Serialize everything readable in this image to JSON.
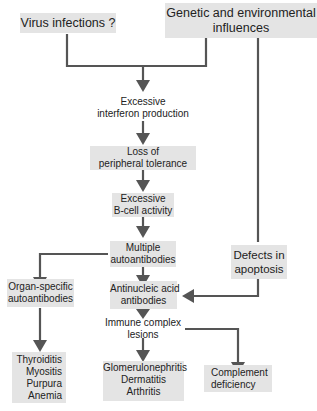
{
  "diagram": {
    "colors": {
      "box_fill": "#e4e4e4",
      "connector": "#555555",
      "text": "#222222",
      "background": "#ffffff"
    },
    "nodes": {
      "virus": {
        "lines": [
          "Virus infections ?"
        ]
      },
      "genetic": {
        "lines": [
          "Genetic and environmental",
          "influences"
        ]
      },
      "interferon": {
        "lines": [
          "Excessive",
          "interferon production"
        ]
      },
      "tolerance": {
        "lines": [
          "Loss of",
          "peripheral tolerance"
        ]
      },
      "bcell": {
        "lines": [
          "Excessive",
          "B-cell activity"
        ]
      },
      "multiple": {
        "lines": [
          "Multiple",
          "autoantibodies"
        ]
      },
      "apoptosis": {
        "lines": [
          "Defects in",
          "apoptosis"
        ]
      },
      "organ": {
        "lines": [
          "Organ-specific",
          "autoantibodies"
        ]
      },
      "antinucleic": {
        "lines": [
          "Antinucleic acid",
          "antibodies"
        ]
      },
      "immune": {
        "lines": [
          "Immune complex",
          "lesions"
        ]
      },
      "organ_diseases": {
        "lines": [
          "Thyroiditis",
          "Myositis",
          "Purpura",
          "Anemia"
        ]
      },
      "lesion_diseases": {
        "lines": [
          "Glomerulonephritis",
          "Dermatitis",
          "Arthritis"
        ]
      },
      "complement": {
        "lines": [
          "Complement",
          "deficiency"
        ]
      }
    },
    "edges": [
      {
        "from": "virus",
        "to": "interferon"
      },
      {
        "from": "genetic",
        "to": "interferon"
      },
      {
        "from": "genetic",
        "to": "apoptosis"
      },
      {
        "from": "interferon",
        "to": "tolerance"
      },
      {
        "from": "tolerance",
        "to": "bcell"
      },
      {
        "from": "bcell",
        "to": "multiple"
      },
      {
        "from": "multiple",
        "to": "organ"
      },
      {
        "from": "multiple",
        "to": "antinucleic"
      },
      {
        "from": "apoptosis",
        "to": "antinucleic"
      },
      {
        "from": "organ",
        "to": "organ_diseases"
      },
      {
        "from": "antinucleic",
        "to": "immune"
      },
      {
        "from": "immune",
        "to": "lesion_diseases"
      },
      {
        "from": "immune",
        "to": "complement"
      }
    ]
  }
}
